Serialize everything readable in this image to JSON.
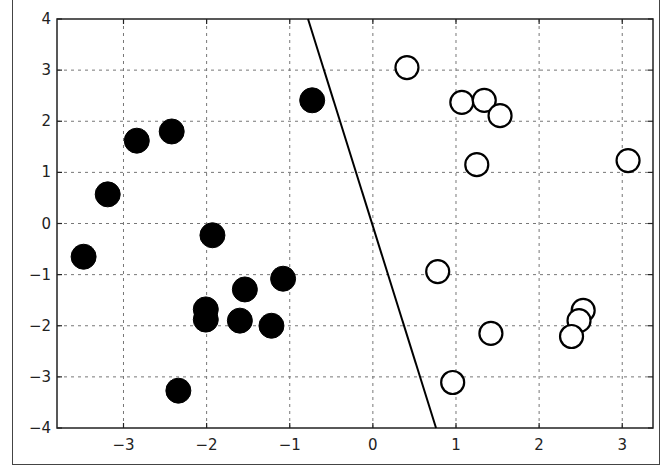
{
  "chart_data": {
    "type": "scatter",
    "title": "",
    "xlabel": "",
    "ylabel": "",
    "xlim": [
      -3.8,
      3.37
    ],
    "ylim": [
      -4,
      4
    ],
    "grid": true,
    "legend": null,
    "x_ticks": [
      -3,
      -2,
      -1,
      0,
      1,
      2,
      3
    ],
    "y_ticks": [
      -4,
      -3,
      -2,
      -1,
      0,
      1,
      2,
      3,
      4
    ],
    "x_tick_labels": [
      "−3",
      "−2",
      "−1",
      "0",
      "1",
      "2",
      "3"
    ],
    "y_tick_labels": [
      "−4",
      "−3",
      "−2",
      "−1",
      "0",
      "1",
      "2",
      "3",
      "4"
    ],
    "series": [
      {
        "name": "class -1 (filled)",
        "marker": "filled-circle",
        "color": "#000000",
        "points": [
          [
            -3.48,
            -0.65
          ],
          [
            -3.19,
            0.57
          ],
          [
            -2.84,
            1.62
          ],
          [
            -2.42,
            1.8
          ],
          [
            -0.73,
            2.41
          ],
          [
            -1.93,
            -0.23
          ],
          [
            -1.08,
            -1.08
          ],
          [
            -1.54,
            -1.29
          ],
          [
            -2.01,
            -1.68
          ],
          [
            -2.01,
            -1.88
          ],
          [
            -1.6,
            -1.9
          ],
          [
            -1.22,
            -2.0
          ],
          [
            -2.34,
            -3.27
          ]
        ]
      },
      {
        "name": "class +1 (hollow)",
        "marker": "hollow-circle",
        "color": "#000000",
        "points": [
          [
            0.41,
            3.05
          ],
          [
            1.07,
            2.37
          ],
          [
            1.34,
            2.41
          ],
          [
            1.53,
            2.11
          ],
          [
            1.25,
            1.15
          ],
          [
            3.07,
            1.23
          ],
          [
            0.78,
            -0.94
          ],
          [
            1.42,
            -2.15
          ],
          [
            0.96,
            -3.11
          ],
          [
            2.53,
            -1.7
          ],
          [
            2.48,
            -1.9
          ],
          [
            2.39,
            -2.21
          ]
        ]
      }
    ],
    "lines": [
      {
        "name": "decision boundary",
        "color": "#000000",
        "points": [
          [
            -0.78,
            4.0
          ],
          [
            0.76,
            -4.0
          ]
        ]
      }
    ]
  }
}
